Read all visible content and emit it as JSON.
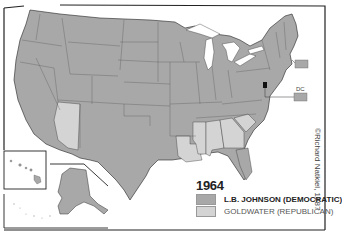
{
  "map": {
    "title_year": "1964",
    "colors": {
      "democratic": "#a8a8a8",
      "republican": "#d4d4d4",
      "border": "#222222",
      "water": "#ffffff"
    },
    "legend": [
      {
        "label": "L.B. JOHNSON (DEMOCRATIC)",
        "color": "#a8a8a8"
      },
      {
        "label": "GOLDWATER (REPUBLICAN)",
        "color": "#d4d4d4"
      }
    ],
    "callouts": {
      "dc": "DC"
    },
    "credit": "©Richard Natkiel, 1987",
    "republican_states": [
      "Arizona",
      "Louisiana",
      "Mississippi",
      "Alabama",
      "Georgia",
      "South Carolina"
    ],
    "insets": [
      "Hawaii",
      "Alaska"
    ]
  }
}
